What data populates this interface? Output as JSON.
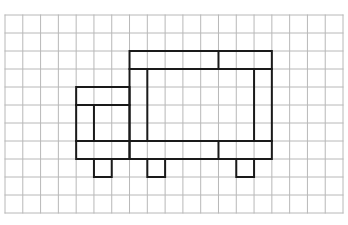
{
  "grid": {
    "origin_x": 5,
    "origin_y": 15,
    "cell_w": 17.79,
    "cell_h": 18,
    "cols": 19,
    "rows": 11,
    "line_color": "#b8b8b8",
    "background": "#ffffff"
  },
  "figure": {
    "stroke_color": "#1a1a1a",
    "stroke_width": 2,
    "segments": [
      {
        "name": "top-bar",
        "rect": [
          7,
          2,
          15,
          3
        ]
      },
      {
        "name": "top-bar-divider",
        "line": [
          12,
          2,
          12,
          3
        ]
      },
      {
        "name": "body-outer",
        "rect": [
          7,
          3,
          15,
          8
        ]
      },
      {
        "name": "body-inner-left",
        "line": [
          8,
          3,
          8,
          7
        ]
      },
      {
        "name": "body-inner-right",
        "line": [
          14,
          3,
          14,
          7
        ]
      },
      {
        "name": "cab-outer",
        "rect": [
          4,
          4,
          7,
          8
        ]
      },
      {
        "name": "cab-top-line",
        "line": [
          4,
          5,
          7,
          5
        ]
      },
      {
        "name": "cab-inner-vertical",
        "line": [
          5,
          5,
          5,
          7
        ]
      },
      {
        "name": "bottom-bar-top",
        "line": [
          4,
          7,
          15,
          7
        ]
      },
      {
        "name": "bottom-bar-divider",
        "line": [
          12,
          7,
          12,
          8
        ]
      },
      {
        "name": "wheel-1",
        "rect": [
          5,
          8,
          6,
          9
        ]
      },
      {
        "name": "wheel-2",
        "rect": [
          8,
          8,
          9,
          9
        ]
      },
      {
        "name": "wheel-3",
        "rect": [
          13,
          8,
          14,
          9
        ]
      }
    ]
  }
}
